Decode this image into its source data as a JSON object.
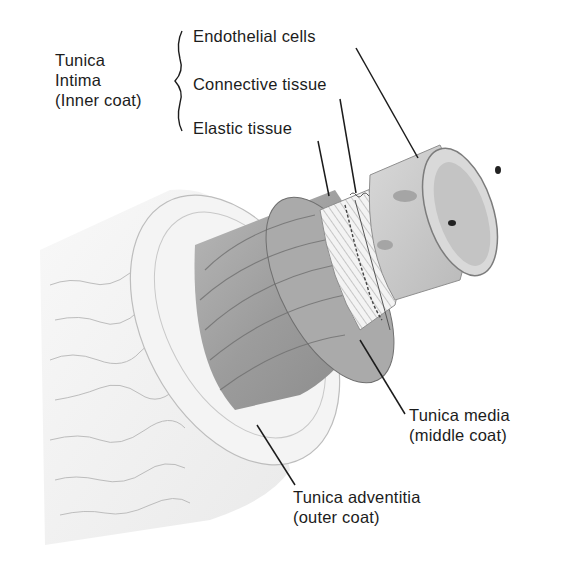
{
  "diagram": {
    "group_label": {
      "lines": [
        "Tunica",
        "Intima",
        "(Inner coat)"
      ]
    },
    "intima_components": [
      {
        "label": "Endothelial cells"
      },
      {
        "label": "Connective tissue"
      },
      {
        "label": "Elastic tissue"
      }
    ],
    "layers": [
      {
        "lines": [
          "Tunica media",
          "(middle coat)"
        ]
      },
      {
        "lines": [
          "Tunica adventitia",
          "(outer coat)"
        ]
      }
    ],
    "colors": {
      "background": "#ffffff",
      "ink": "#1c1c1c",
      "adventitia": "#f1f1f1",
      "media": "#9a9a9a",
      "elastic": "#e4e4e4",
      "endothelium": "#cfcfcf"
    }
  }
}
